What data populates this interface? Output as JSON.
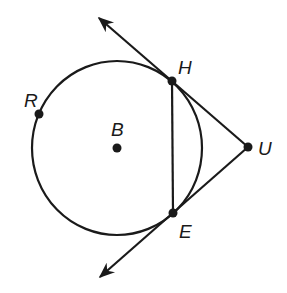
{
  "diagram": {
    "type": "circle-tangents",
    "stroke_color": "#1a1a1a",
    "background": "#ffffff",
    "circle": {
      "name": "B",
      "cx": 117,
      "cy": 148,
      "rx": 85,
      "ry": 87
    },
    "points": {
      "R": {
        "label": "R",
        "x": 39,
        "y": 114,
        "label_x": 24,
        "label_y": 107
      },
      "B": {
        "label": "B",
        "x": 117,
        "y": 148,
        "label_x": 111,
        "label_y": 136
      },
      "H": {
        "label": "H",
        "x": 172,
        "y": 81,
        "label_x": 178,
        "label_y": 74
      },
      "U": {
        "label": "U",
        "x": 248,
        "y": 147,
        "label_x": 258,
        "label_y": 155
      },
      "E": {
        "label": "E",
        "x": 173,
        "y": 213,
        "label_x": 179,
        "label_y": 238
      }
    },
    "segments": [
      {
        "from": "H",
        "to": "E",
        "label": "HE"
      },
      {
        "from": "H",
        "to": "U",
        "label": "HU"
      },
      {
        "from": "E",
        "to": "U",
        "label": "EU"
      }
    ],
    "rays": [
      {
        "from": "U",
        "through": "H",
        "tip_x": 99,
        "tip_y": 18,
        "label": "ray UH"
      },
      {
        "from": "U",
        "through": "E",
        "tip_x": 100,
        "tip_y": 277,
        "label": "ray UE"
      }
    ]
  }
}
